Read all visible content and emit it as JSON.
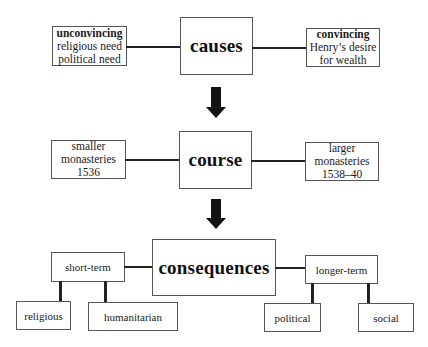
{
  "diagram": {
    "rows": [
      {
        "center": "causes",
        "left": {
          "heading": "unconvincing",
          "lines": [
            "religious need",
            "political need"
          ]
        },
        "right": {
          "heading": "convincing",
          "lines": [
            "Henry’s desire",
            "for wealth"
          ]
        }
      },
      {
        "center": "course",
        "left": {
          "lines": [
            "smaller",
            "monasteries",
            "1536"
          ]
        },
        "right": {
          "lines": [
            "larger",
            "monasteries",
            "1538–40"
          ]
        }
      },
      {
        "center": "consequences",
        "left": {
          "label": "short-term",
          "children": [
            "religious",
            "humanitarian"
          ]
        },
        "right": {
          "label": "longer-term",
          "children": [
            "political",
            "social"
          ]
        }
      }
    ],
    "arrows": [
      "causes-to-course",
      "course-to-consequences"
    ],
    "colors": {
      "line": "#222222",
      "border": "#555555",
      "background": "#ffffff"
    }
  }
}
